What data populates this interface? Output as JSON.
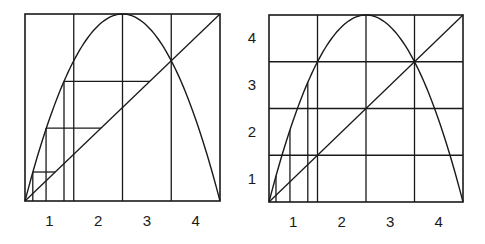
{
  "figure": {
    "colors": {
      "ink": "#1a1a1a",
      "background": "#ffffff"
    }
  },
  "panels": [
    {
      "id": "left",
      "box": {
        "x": 25,
        "y": 14,
        "w": 195,
        "h": 187
      },
      "x_ticks": [
        "1",
        "2",
        "3",
        "4"
      ],
      "y_ticks": [],
      "grid_vertical": [
        0.25,
        0.5,
        0.75
      ],
      "grid_horizontal": [],
      "cobweb": {
        "verticals": [
          {
            "x": 0.04,
            "y0": 0,
            "y1": 0.155
          },
          {
            "x": 0.108,
            "y0": 0,
            "y1": 0.39
          },
          {
            "x": 0.2,
            "y0": 0,
            "y1": 0.64
          }
        ],
        "horizontals": [
          {
            "y": 0.155,
            "x0": 0.04,
            "x1": 0.155
          },
          {
            "y": 0.39,
            "x0": 0.108,
            "x1": 0.39
          },
          {
            "y": 0.64,
            "x0": 0.2,
            "x1": 0.64
          }
        ]
      }
    },
    {
      "id": "right",
      "box": {
        "x": 269,
        "y": 15,
        "w": 194,
        "h": 187
      },
      "x_ticks": [
        "1",
        "2",
        "3",
        "4"
      ],
      "y_ticks": [
        "1",
        "2",
        "3",
        "4"
      ],
      "grid_vertical": [
        0.25,
        0.5,
        0.75
      ],
      "grid_horizontal": [
        0.25,
        0.5,
        0.75
      ],
      "cobweb": {
        "verticals": [
          {
            "x": 0.036,
            "y0": 0,
            "y1": 0.14
          },
          {
            "x": 0.108,
            "y0": 0,
            "y1": 0.385
          },
          {
            "x": 0.2,
            "y0": 0,
            "y1": 0.64
          }
        ],
        "horizontals": []
      }
    }
  ],
  "curve": {
    "function": "4x(1-x)",
    "fixed_point": 0.75,
    "peak": [
      0.5,
      1.0
    ]
  }
}
